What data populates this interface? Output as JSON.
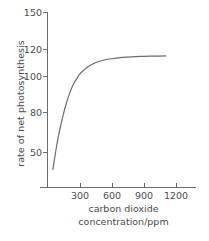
{
  "chart_data": {
    "type": "line",
    "title": "",
    "subtitle": "",
    "xlabel": "carbon dioxide concentration/ppm",
    "xlabel_lines": [
      "carbon dioxide",
      "concentration/ppm"
    ],
    "ylabel": "rate of net photosynthesis",
    "xlim": [
      0,
      1280
    ],
    "ylim": [
      0,
      150
    ],
    "xticks": [
      300,
      600,
      900,
      1200
    ],
    "xtick_labels": [
      "300",
      "600",
      "900",
      "1200"
    ],
    "yticks": [
      50,
      80,
      100,
      120,
      150
    ],
    "ytick_labels": [
      "50",
      "80",
      "100",
      "120",
      "150"
    ],
    "grid": false,
    "legend": false,
    "legend_position": "none",
    "series": [
      {
        "name": "net photosynthesis",
        "color": "#6b6b6b",
        "line_width": 1.2,
        "x": [
          50,
          75,
          100,
          125,
          150,
          175,
          200,
          225,
          250,
          275,
          300,
          340,
          380,
          420,
          470,
          520,
          580,
          640,
          700,
          780,
          860,
          950,
          1040,
          1100
        ],
        "y": [
          38,
          50,
          61,
          70,
          78,
          85,
          91,
          96,
          100,
          103,
          106,
          109,
          111.5,
          113.2,
          114.8,
          115.9,
          116.8,
          117.4,
          117.9,
          118.3,
          118.6,
          118.8,
          118.9,
          119
        ]
      }
    ]
  },
  "axes": {
    "tick_color": "#6b6b6b",
    "axis_color": "#6b6b6b",
    "text_color": "#4a4a4a"
  }
}
